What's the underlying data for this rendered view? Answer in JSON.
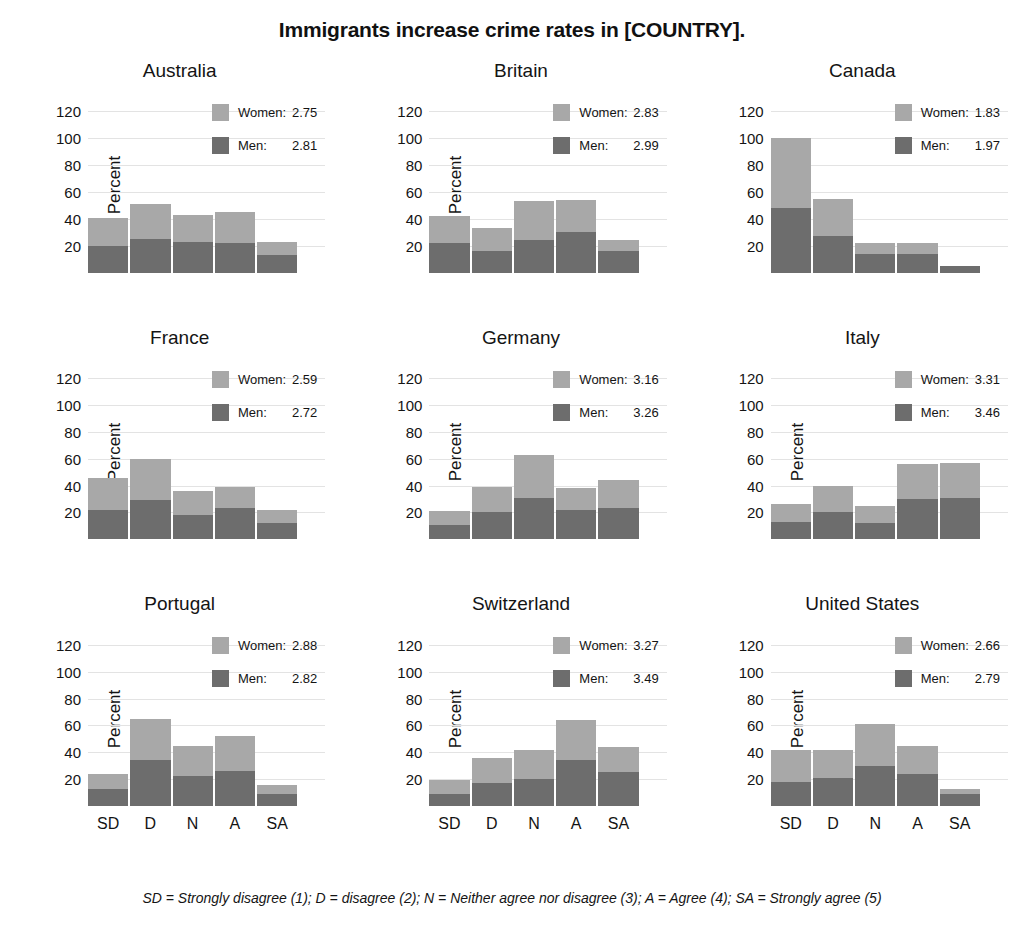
{
  "title": "Immigrants increase crime rates in [COUNTRY].",
  "footnote": "SD = Strongly disagree (1); D = disagree (2); N = Neither agree nor disagree (3); A = Agree (4); SA = Strongly agree (5)",
  "axis": {
    "ylabel": "Percent",
    "yticks": [
      "20",
      "40",
      "60",
      "80",
      "100",
      "120"
    ],
    "xticks": [
      "SD",
      "D",
      "N",
      "A",
      "SA"
    ]
  },
  "legend": {
    "women_label": "Women:",
    "men_label": "Men:"
  },
  "colors": {
    "women": "#a8a8a8",
    "men": "#6d6d6d",
    "grid": "#e3e3e3",
    "text": "#141414"
  },
  "chart_data": {
    "type": "bar",
    "title": "Immigrants increase crime rates in [COUNTRY].",
    "subtitle": "",
    "xlabel": "",
    "ylabel": "Percent",
    "ylim": [
      0,
      130
    ],
    "grid": true,
    "legend_position": "inside-top-right",
    "stacked": true,
    "categories": [
      "SD",
      "D",
      "N",
      "A",
      "SA"
    ],
    "series_names": [
      "Men",
      "Women"
    ],
    "annotation": "SD = Strongly disagree (1); D = disagree (2); N = Neither agree nor disagree (3); A = Agree (4); SA = Strongly agree (5)",
    "panels": [
      {
        "name": "Australia",
        "means": {
          "women": "2.75",
          "men": "2.81"
        },
        "series": [
          {
            "name": "Men",
            "values": [
              20,
              25,
              23,
              22,
              13
            ]
          },
          {
            "name": "Women",
            "values": [
              21,
              26,
              20,
              23,
              10
            ]
          }
        ],
        "totals": [
          41,
          51,
          43,
          45,
          23
        ]
      },
      {
        "name": "Britain",
        "means": {
          "women": "2.83",
          "men": "2.99"
        },
        "series": [
          {
            "name": "Men",
            "values": [
              22,
              16,
              24,
              30,
              16
            ]
          },
          {
            "name": "Women",
            "values": [
              20,
              17,
              29,
              24,
              8
            ]
          }
        ],
        "totals": [
          42,
          33,
          53,
          54,
          24
        ]
      },
      {
        "name": "Canada",
        "means": {
          "women": "1.83",
          "men": "1.97"
        },
        "series": [
          {
            "name": "Men",
            "values": [
              48,
              27,
              14,
              14,
              5
            ]
          },
          {
            "name": "Women",
            "values": [
              52,
              28,
              8,
              8,
              0
            ]
          }
        ],
        "totals": [
          100,
          55,
          22,
          22,
          5
        ]
      },
      {
        "name": "France",
        "means": {
          "women": "2.59",
          "men": "2.72"
        },
        "series": [
          {
            "name": "Men",
            "values": [
              22,
              29,
              18,
              23,
              12
            ]
          },
          {
            "name": "Women",
            "values": [
              24,
              31,
              18,
              16,
              10
            ]
          }
        ],
        "totals": [
          46,
          60,
          36,
          39,
          22
        ]
      },
      {
        "name": "Germany",
        "means": {
          "women": "3.16",
          "men": "3.26"
        },
        "series": [
          {
            "name": "Men",
            "values": [
              11,
              20,
              31,
              22,
              23
            ]
          },
          {
            "name": "Women",
            "values": [
              10,
              19,
              32,
              16,
              21
            ]
          }
        ],
        "totals": [
          21,
          39,
          63,
          38,
          44
        ]
      },
      {
        "name": "Italy",
        "means": {
          "women": "3.31",
          "men": "3.46"
        },
        "series": [
          {
            "name": "Men",
            "values": [
              13,
              20,
              12,
              30,
              31
            ]
          },
          {
            "name": "Women",
            "values": [
              13,
              20,
              13,
              26,
              26
            ]
          }
        ],
        "totals": [
          26,
          40,
          25,
          56,
          57
        ]
      },
      {
        "name": "Portugal",
        "means": {
          "women": "2.88",
          "men": "2.82"
        },
        "series": [
          {
            "name": "Men",
            "values": [
              13,
              34,
              22,
              26,
              9
            ]
          },
          {
            "name": "Women",
            "values": [
              11,
              31,
              23,
              26,
              7
            ]
          }
        ],
        "totals": [
          24,
          65,
          45,
          52,
          16
        ]
      },
      {
        "name": "Switzerland",
        "means": {
          "women": "3.27",
          "men": "3.49"
        },
        "series": [
          {
            "name": "Men",
            "values": [
              9,
              17,
              20,
              34,
              25
            ]
          },
          {
            "name": "Women",
            "values": [
              10,
              19,
              22,
              30,
              19
            ]
          }
        ],
        "totals": [
          19,
          36,
          42,
          64,
          44
        ]
      },
      {
        "name": "United States",
        "means": {
          "women": "2.66",
          "men": "2.79"
        },
        "series": [
          {
            "name": "Men",
            "values": [
              18,
              21,
              30,
              24,
              9
            ]
          },
          {
            "name": "Women",
            "values": [
              24,
              21,
              31,
              21,
              4
            ]
          }
        ],
        "totals": [
          42,
          42,
          61,
          45,
          13
        ]
      }
    ]
  }
}
